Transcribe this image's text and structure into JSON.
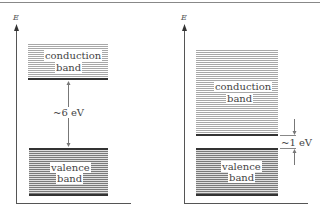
{
  "left_panel": {
    "axis_label": "E",
    "conduction_band": {
      "line1": "conduction",
      "line2": "band"
    },
    "valence_band": {
      "line1": "valence",
      "line2": "band"
    },
    "gap_label": "~6 eV"
  },
  "right_panel": {
    "axis_label": "E",
    "conduction_band": {
      "line1": "conduction",
      "line2": "band"
    },
    "valence_band": {
      "line1": "valence",
      "line2": "band"
    },
    "gap_label": "~1 eV"
  }
}
